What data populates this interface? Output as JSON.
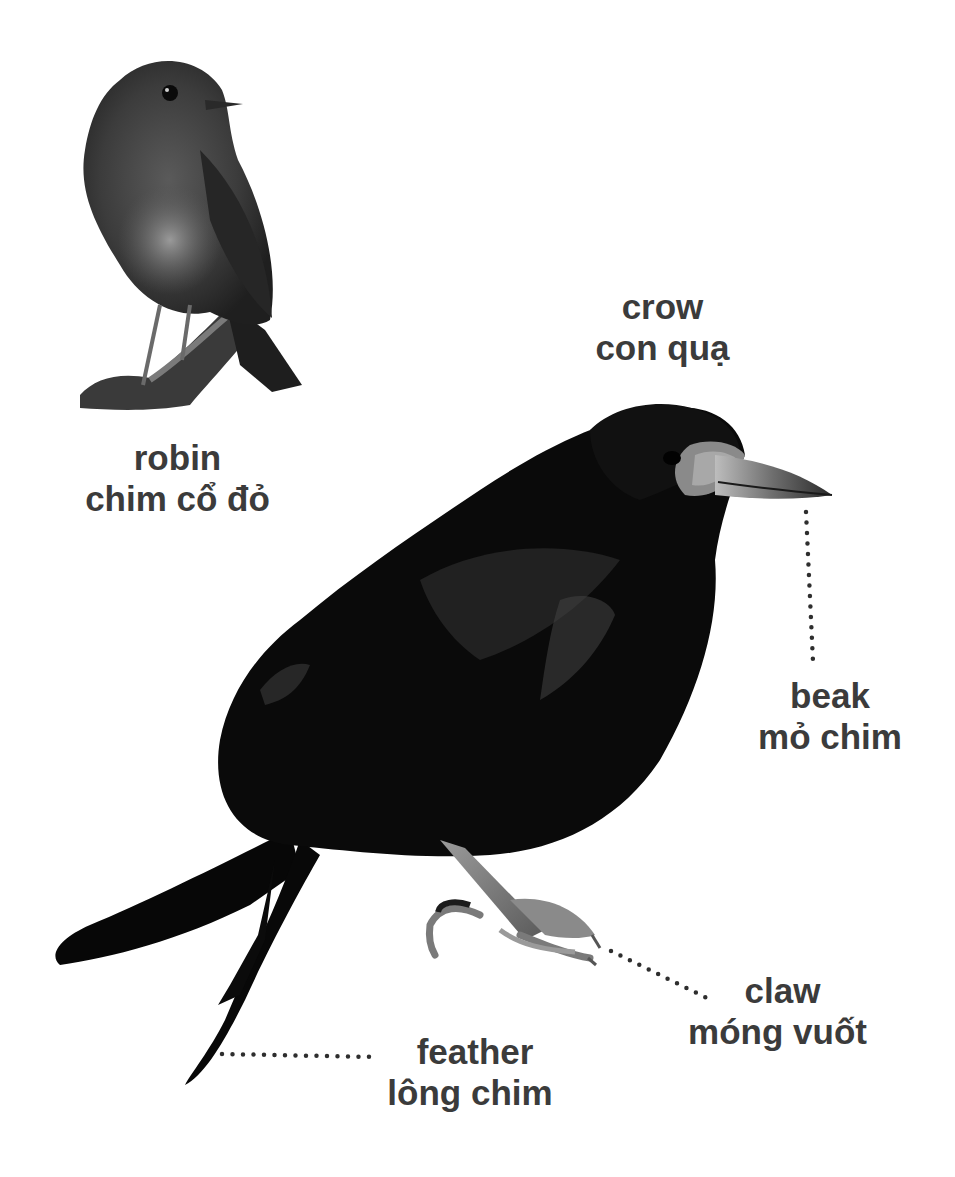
{
  "diagram": {
    "colors": {
      "background": "#ffffff",
      "label_text": "#3b3b3b",
      "leader_dots": "#2e2e2e",
      "crow_body": "#0a0a0a",
      "robin_body": "#4a4a4a"
    }
  },
  "labels": {
    "robin": {
      "en": "robin",
      "vi": "chim cổ đỏ"
    },
    "crow": {
      "en": "crow",
      "vi": "con quạ"
    },
    "beak": {
      "en": "beak",
      "vi": "mỏ chim"
    },
    "claw": {
      "en": "claw",
      "vi": "móng vuốt"
    },
    "feather": {
      "en": "feather",
      "vi": "lông chim"
    }
  },
  "images": {
    "robin": "robin-photo",
    "crow": "crow-photo"
  }
}
